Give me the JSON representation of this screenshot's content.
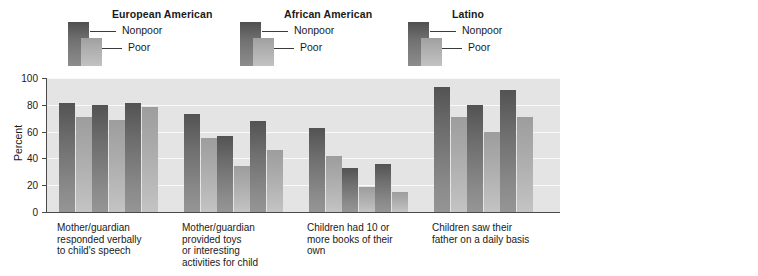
{
  "legends": [
    {
      "title": "European American",
      "nonpoor": "Nonpoor",
      "poor": "Poor"
    },
    {
      "title": "African American",
      "nonpoor": "Nonpoor",
      "poor": "Poor"
    },
    {
      "title": "Latino",
      "nonpoor": "Nonpoor",
      "poor": "Poor"
    }
  ],
  "colors": {
    "nonpoor": "#6e6e6e",
    "poor": "#b0b0b0",
    "plot_bg": "#e4e4e4",
    "gridline": "#fafafa",
    "axis": "#4a4a4a"
  },
  "chart_data": [
    {
      "type": "bar",
      "title": "",
      "xlabel": "",
      "ylabel": "Percent",
      "ylim": [
        0,
        100
      ],
      "yticks": [
        0,
        20,
        40,
        60,
        80,
        100
      ],
      "grid": true,
      "legend_position": "top",
      "categories": [
        "Mother/guardian\nresponded verbally\nto child's speech",
        "Mother/guardian\nprovided toys\nor interesting\nactivities for child",
        "Children had 10 or\nmore books of their\nown",
        "Children saw their\nfather on a daily basis"
      ],
      "series": [
        {
          "name": "European American Nonpoor",
          "group": "European American",
          "status": "Nonpoor",
          "values": [
            81,
            73,
            63,
            93
          ]
        },
        {
          "name": "European American Poor",
          "group": "European American",
          "status": "Poor",
          "values": [
            71,
            55,
            42,
            71
          ]
        },
        {
          "name": "African American Nonpoor",
          "group": "African American",
          "status": "Nonpoor",
          "values": [
            80,
            57,
            33,
            80
          ]
        },
        {
          "name": "African American Poor",
          "group": "African American",
          "status": "Poor",
          "values": [
            69,
            34,
            19,
            60
          ]
        },
        {
          "name": "Latino Nonpoor",
          "group": "Latino",
          "status": "Nonpoor",
          "values": [
            81,
            68,
            36,
            91
          ]
        },
        {
          "name": "Latino Poor",
          "group": "Latino",
          "status": "Poor",
          "values": [
            78,
            46,
            15,
            71
          ]
        }
      ]
    },
    {
      "type": "bar",
      "title": "",
      "xlabel": "",
      "ylabel": "Percent",
      "ylim": [
        0,
        15
      ],
      "yticks": [
        0,
        2,
        4,
        6,
        8,
        10,
        12,
        14
      ],
      "grid": true,
      "legend_position": "top",
      "categories": [
        "Mother/guardian\nslapped or spanked\nchild at least once"
      ],
      "series": [
        {
          "name": "European American Nonpoor",
          "group": "European American",
          "status": "Nonpoor",
          "values": [
            3.3
          ]
        },
        {
          "name": "European American Poor",
          "group": "European American",
          "status": "Poor",
          "values": [
            8.3
          ]
        },
        {
          "name": "African American Nonpoor",
          "group": "African American",
          "status": "Nonpoor",
          "values": [
            8.8
          ]
        },
        {
          "name": "African American Poor",
          "group": "African American",
          "status": "Poor",
          "values": [
            13.5
          ]
        },
        {
          "name": "Latino Nonpoor",
          "group": "Latino",
          "status": "Nonpoor",
          "values": [
            4.8
          ]
        },
        {
          "name": "Latino Poor",
          "group": "Latino",
          "status": "Poor",
          "values": [
            8.1
          ]
        }
      ]
    }
  ]
}
